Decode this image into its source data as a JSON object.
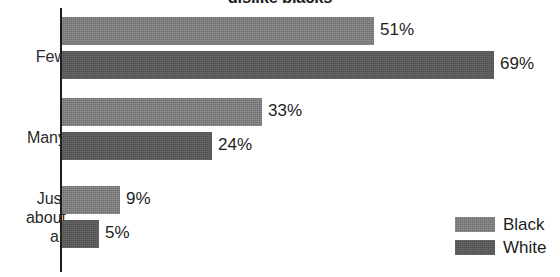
{
  "chart_data": {
    "type": "bar",
    "orientation": "horizontal",
    "title": "dislike blacks",
    "xlabel": "",
    "ylabel": "",
    "categories": [
      "Few",
      "Many",
      "Just\nabout\nall"
    ],
    "series": [
      {
        "name": "Black",
        "values": [
          51,
          33,
          9
        ],
        "color": "#7b7b7b"
      },
      {
        "name": "White",
        "values": [
          69,
          24,
          5
        ],
        "color": "#575757"
      }
    ],
    "value_labels": {
      "few_black": "51%",
      "few_white": "69%",
      "many_black": "33%",
      "many_white": "24%",
      "just_black": "9%",
      "just_white": "5%"
    },
    "xlim": [
      0,
      69
    ],
    "grid": false,
    "legend": {
      "position": "bottom-right",
      "entries": [
        {
          "label": "Black",
          "swatch": "black-series-swatch"
        },
        {
          "label": "White",
          "swatch": "white-series-swatch"
        }
      ]
    },
    "axis": {
      "category_axis_visible": true,
      "value_axis_visible": false
    }
  }
}
